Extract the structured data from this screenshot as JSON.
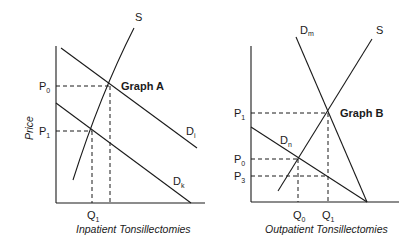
{
  "graph_a": {
    "title": "Graph A",
    "y_axis_label": "Price",
    "x_axis_label": "Inpatient Tonsillectomies",
    "price_labels": [
      {
        "base": "P",
        "sub": "0"
      },
      {
        "base": "P",
        "sub": "1"
      }
    ],
    "quantity_labels": [
      {
        "base": "Q",
        "sub": "1"
      }
    ],
    "curves": [
      {
        "base": "S",
        "sub": ""
      },
      {
        "base": "D",
        "sub": "i"
      },
      {
        "base": "D",
        "sub": "k"
      }
    ]
  },
  "graph_b": {
    "title": "Graph B",
    "x_axis_label": "Outpatient Tonsillectomies",
    "price_labels": [
      {
        "base": "P",
        "sub": "1"
      },
      {
        "base": "P",
        "sub": "0"
      },
      {
        "base": "P",
        "sub": "3"
      }
    ],
    "quantity_labels": [
      {
        "base": "Q",
        "sub": "0"
      },
      {
        "base": "Q",
        "sub": "1"
      }
    ],
    "curves": [
      {
        "base": "D",
        "sub": "m"
      },
      {
        "base": "S",
        "sub": ""
      },
      {
        "base": "D",
        "sub": "n"
      }
    ]
  }
}
